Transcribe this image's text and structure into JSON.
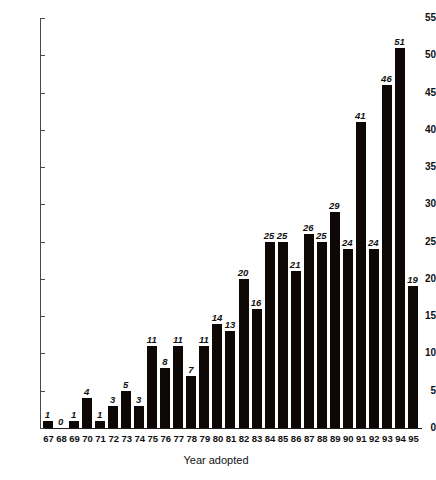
{
  "chart_data": {
    "type": "bar",
    "title": "",
    "subtitle": "",
    "xlabel": "Year adopted",
    "ylabel": "",
    "categories": [
      "67",
      "68",
      "69",
      "70",
      "71",
      "72",
      "73",
      "74",
      "75",
      "76",
      "77",
      "78",
      "79",
      "80",
      "81",
      "82",
      "83",
      "84",
      "85",
      "86",
      "87",
      "88",
      "89",
      "90",
      "91",
      "92",
      "93",
      "94",
      "95"
    ],
    "values": [
      1,
      0,
      1,
      4,
      1,
      3,
      5,
      3,
      11,
      8,
      11,
      7,
      11,
      14,
      13,
      20,
      16,
      25,
      25,
      21,
      26,
      25,
      29,
      24,
      41,
      24,
      46,
      51,
      19
    ],
    "data_labels": [
      "1",
      "0",
      "1",
      "4",
      "1",
      "3",
      "5",
      "3",
      "11",
      "8",
      "11",
      "7",
      "11",
      "14",
      "13",
      "20",
      "16",
      "25",
      "25",
      "21",
      "26",
      "25",
      "29",
      "24",
      "41",
      "24",
      "46",
      "51",
      "19"
    ],
    "ylim": [
      0,
      55
    ],
    "ytick_values": [
      0,
      5,
      10,
      15,
      20,
      25,
      30,
      35,
      40,
      45,
      50,
      55
    ],
    "ytick_labels": [
      "0",
      "5",
      "10",
      "15",
      "20",
      "25",
      "30",
      "35",
      "40",
      "45",
      "50",
      "55"
    ],
    "grid": false,
    "legend": null,
    "legend_position": "none",
    "bar_color": "#0d0806",
    "axis_color": "#4a4a4a",
    "data_label_style": "italic-bold",
    "annotations": []
  }
}
